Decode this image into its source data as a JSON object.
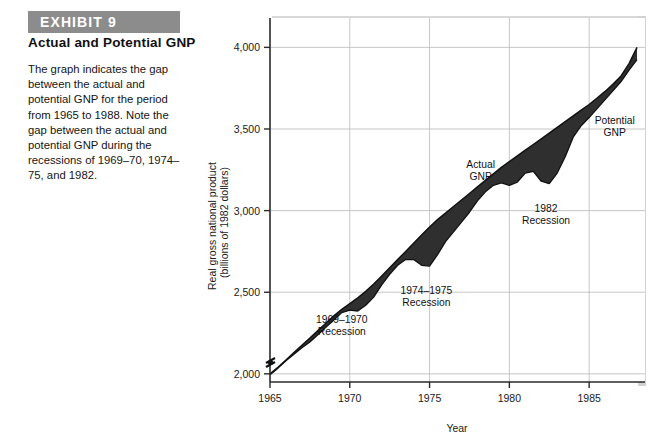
{
  "exhibit": {
    "banner_label": "EXHIBIT 9",
    "subtitle": "Actual and Potential GNP",
    "body_text": "The graph indicates the gap between the actual and potential GNP for the period from 1965 to 1988. Note the gap between the actual and potential GNP during the recessions of 1969–70, 1974–75, and 1982.",
    "banner_color": "#8c8c8c"
  },
  "chart_data": {
    "type": "area",
    "title": "Actual and Potential GNP",
    "xlabel": "Year",
    "ylabel": "Real gross national product\n(billions of 1982 dollars)",
    "ylabel_line1": "Real gross national product",
    "ylabel_line2": "(billions of 1982 dollars)",
    "xlim": [
      1965,
      1988.5
    ],
    "ylim": [
      1950,
      4180
    ],
    "xticks": [
      1965,
      1970,
      1975,
      1980,
      1985
    ],
    "xtick_labels": [
      "1965",
      "1970",
      "1975",
      "1980",
      "1985"
    ],
    "yticks": [
      2000,
      2500,
      3000,
      3500,
      4000
    ],
    "ytick_labels": [
      "2,000",
      "2,500",
      "3,000",
      "3,500",
      "4,000"
    ],
    "grid": true,
    "axis_break": true,
    "legend_position": "inline-annotations",
    "fill_color": "#2b2b2b",
    "line_color": "#111111",
    "x": [
      1965.0,
      1965.5,
      1966.0,
      1966.5,
      1967.0,
      1967.5,
      1968.0,
      1968.5,
      1969.0,
      1969.5,
      1970.0,
      1970.5,
      1971.0,
      1971.5,
      1972.0,
      1972.5,
      1973.0,
      1973.5,
      1974.0,
      1974.5,
      1975.0,
      1975.5,
      1976.0,
      1976.5,
      1977.0,
      1977.5,
      1978.0,
      1978.5,
      1979.0,
      1979.5,
      1980.0,
      1980.5,
      1981.0,
      1981.5,
      1982.0,
      1982.5,
      1983.0,
      1983.5,
      1984.0,
      1984.5,
      1985.0,
      1985.5,
      1986.0,
      1986.5,
      1987.0,
      1987.5,
      1988.0
    ],
    "series": [
      {
        "name": "Potential GNP",
        "label": "Potential\nGNP",
        "values": [
          2000,
          2040,
          2085,
          2130,
          2175,
          2220,
          2265,
          2310,
          2355,
          2395,
          2430,
          2465,
          2505,
          2550,
          2600,
          2650,
          2700,
          2750,
          2800,
          2850,
          2900,
          2945,
          2985,
          3025,
          3065,
          3105,
          3145,
          3185,
          3225,
          3265,
          3300,
          3335,
          3370,
          3405,
          3440,
          3475,
          3510,
          3545,
          3580,
          3615,
          3650,
          3690,
          3730,
          3775,
          3825,
          3900,
          4000
        ]
      },
      {
        "name": "Actual GNP",
        "label": "Actual\nGNP",
        "values": [
          1995,
          2035,
          2080,
          2120,
          2160,
          2195,
          2240,
          2285,
          2330,
          2375,
          2390,
          2385,
          2420,
          2470,
          2545,
          2610,
          2665,
          2700,
          2700,
          2665,
          2660,
          2730,
          2810,
          2870,
          2930,
          2990,
          3060,
          3115,
          3155,
          3170,
          3155,
          3175,
          3230,
          3240,
          3180,
          3165,
          3230,
          3330,
          3450,
          3520,
          3570,
          3625,
          3680,
          3735,
          3790,
          3860,
          3925
        ]
      }
    ],
    "annotations": [
      {
        "text_line1": "1969–1970",
        "text_line2": "Recession",
        "x": 1969.5,
        "y": 2310
      },
      {
        "text_line1": "1974–1975",
        "text_line2": "Recession",
        "x": 1974.8,
        "y": 2490
      },
      {
        "text_line1": "1982",
        "text_line2": "Recession",
        "x": 1982.3,
        "y": 2990
      },
      {
        "text_line1": "Actual",
        "text_line2": "GNP",
        "x": 1978.2,
        "y": 3260
      },
      {
        "text_line1": "Potential",
        "text_line2": "GNP",
        "x": 1986.6,
        "y": 3530
      }
    ]
  }
}
